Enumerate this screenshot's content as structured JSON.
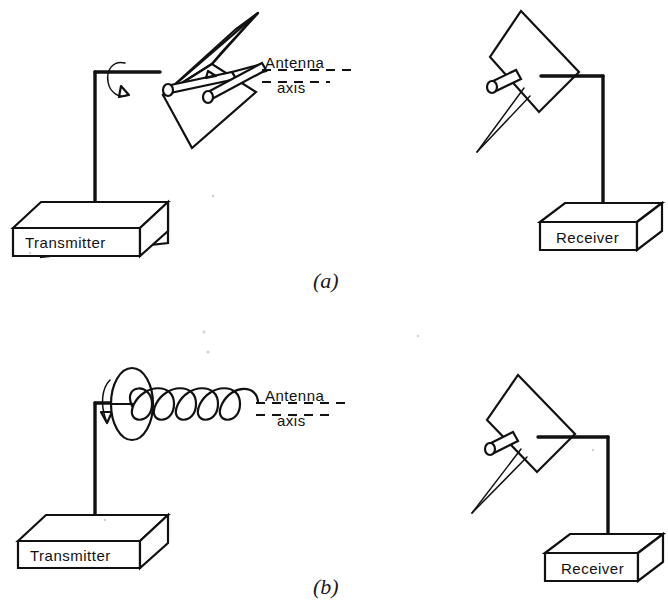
{
  "figure": {
    "background_color": "#ffffff",
    "ink_color": "#111111",
    "width": 668,
    "height": 606
  },
  "panels": [
    {
      "id": "a",
      "letter": "(a)",
      "transmit_antenna_type": "corner-reflector-dipole",
      "receive_antenna_type": "flat-reflector-dipole",
      "rotation_indicated": true,
      "axis_label_line1": "Antenna",
      "axis_label_line2": "axis",
      "transmitter_label": "Transmitter",
      "receiver_label": "Receiver"
    },
    {
      "id": "b",
      "letter": "(b)",
      "transmit_antenna_type": "helical-antenna-with-ground-plane",
      "helix_turns": 6,
      "receive_antenna_type": "flat-reflector-dipole",
      "rotation_indicated": true,
      "axis_label_line1": "Antenna",
      "axis_label_line2": "axis",
      "transmitter_label": "Transmitter",
      "receiver_label": "Receiver"
    }
  ],
  "labels": {
    "antenna_axis_line1": "Antenna",
    "antenna_axis_line2": "axis",
    "transmitter": "Transmitter",
    "receiver": "Receiver",
    "panel_a": "(a)",
    "panel_b": "(b)"
  }
}
